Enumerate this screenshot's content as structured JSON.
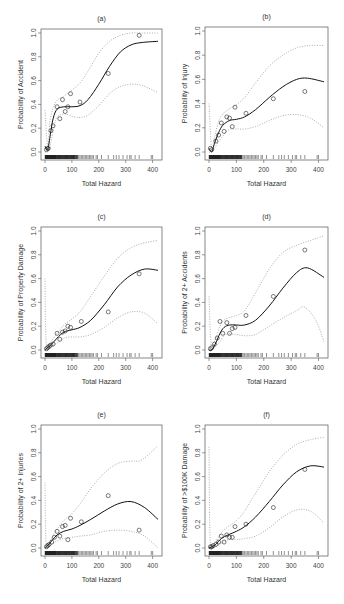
{
  "figure": {
    "xlabel": "Total Hazard",
    "x_ticks": [
      0,
      100,
      200,
      300,
      400
    ],
    "y_ticks": [
      "0.0",
      "0.2",
      "0.4",
      "0.6",
      "0.8",
      "1.0"
    ]
  },
  "chart_data": [
    {
      "type": "line",
      "panel": "(a)",
      "title": "(a)",
      "xlabel": "Total Hazard",
      "ylabel": "Probability of Accident",
      "xlim": [
        0,
        420
      ],
      "ylim": [
        0,
        1
      ],
      "fit": [
        [
          0,
          0.05
        ],
        [
          10,
          0.02
        ],
        [
          20,
          0.15
        ],
        [
          30,
          0.28
        ],
        [
          45,
          0.36
        ],
        [
          70,
          0.38
        ],
        [
          100,
          0.38
        ],
        [
          130,
          0.39
        ],
        [
          160,
          0.44
        ],
        [
          200,
          0.57
        ],
        [
          240,
          0.72
        ],
        [
          280,
          0.84
        ],
        [
          320,
          0.9
        ],
        [
          360,
          0.92
        ],
        [
          420,
          0.93
        ]
      ],
      "upper": [
        [
          0,
          0.35
        ],
        [
          10,
          0.05
        ],
        [
          20,
          0.28
        ],
        [
          40,
          0.42
        ],
        [
          70,
          0.47
        ],
        [
          100,
          0.52
        ],
        [
          130,
          0.58
        ],
        [
          160,
          0.68
        ],
        [
          200,
          0.83
        ],
        [
          240,
          0.93
        ],
        [
          280,
          0.98
        ],
        [
          320,
          1.0
        ],
        [
          360,
          1.0
        ],
        [
          420,
          1.0
        ]
      ],
      "lower": [
        [
          0,
          0.0
        ],
        [
          10,
          0.0
        ],
        [
          20,
          0.06
        ],
        [
          40,
          0.27
        ],
        [
          70,
          0.32
        ],
        [
          100,
          0.3
        ],
        [
          130,
          0.29
        ],
        [
          160,
          0.31
        ],
        [
          200,
          0.39
        ],
        [
          240,
          0.49
        ],
        [
          280,
          0.55
        ],
        [
          320,
          0.57
        ],
        [
          360,
          0.56
        ],
        [
          420,
          0.5
        ]
      ],
      "points": [
        [
          5,
          0.02
        ],
        [
          10,
          0.03
        ],
        [
          12,
          0.03
        ],
        [
          22,
          0.18
        ],
        [
          30,
          0.22
        ],
        [
          45,
          0.38
        ],
        [
          55,
          0.28
        ],
        [
          65,
          0.44
        ],
        [
          75,
          0.34
        ],
        [
          85,
          0.38
        ],
        [
          95,
          0.49
        ],
        [
          130,
          0.42
        ],
        [
          235,
          0.66
        ],
        [
          350,
          0.98
        ]
      ]
    },
    {
      "type": "line",
      "panel": "(b)",
      "title": "(b)",
      "xlabel": "Total Hazard",
      "ylabel": "Probability of Injury",
      "xlim": [
        0,
        420
      ],
      "ylim": [
        0,
        1
      ],
      "fit": [
        [
          0,
          0.03
        ],
        [
          10,
          0.0
        ],
        [
          20,
          0.07
        ],
        [
          35,
          0.16
        ],
        [
          50,
          0.22
        ],
        [
          75,
          0.26
        ],
        [
          100,
          0.27
        ],
        [
          130,
          0.29
        ],
        [
          170,
          0.35
        ],
        [
          220,
          0.45
        ],
        [
          270,
          0.54
        ],
        [
          320,
          0.6
        ],
        [
          360,
          0.61
        ],
        [
          420,
          0.58
        ]
      ],
      "upper": [
        [
          0,
          0.4
        ],
        [
          10,
          0.02
        ],
        [
          20,
          0.12
        ],
        [
          40,
          0.28
        ],
        [
          70,
          0.35
        ],
        [
          100,
          0.39
        ],
        [
          130,
          0.45
        ],
        [
          170,
          0.57
        ],
        [
          220,
          0.71
        ],
        [
          270,
          0.8
        ],
        [
          320,
          0.86
        ],
        [
          370,
          0.88
        ],
        [
          420,
          0.88
        ]
      ],
      "lower": [
        [
          0,
          0.0
        ],
        [
          10,
          0.0
        ],
        [
          20,
          0.03
        ],
        [
          40,
          0.1
        ],
        [
          70,
          0.18
        ],
        [
          100,
          0.19
        ],
        [
          130,
          0.19
        ],
        [
          170,
          0.21
        ],
        [
          220,
          0.26
        ],
        [
          270,
          0.3
        ],
        [
          320,
          0.31
        ],
        [
          370,
          0.28
        ],
        [
          420,
          0.2
        ]
      ],
      "points": [
        [
          5,
          0.03
        ],
        [
          10,
          0.02
        ],
        [
          25,
          0.09
        ],
        [
          35,
          0.14
        ],
        [
          45,
          0.24
        ],
        [
          55,
          0.17
        ],
        [
          65,
          0.29
        ],
        [
          75,
          0.28
        ],
        [
          85,
          0.21
        ],
        [
          95,
          0.37
        ],
        [
          135,
          0.32
        ],
        [
          235,
          0.44
        ],
        [
          350,
          0.5
        ]
      ]
    },
    {
      "type": "line",
      "panel": "(c)",
      "title": "(c)",
      "xlabel": "Total Hazard",
      "ylabel": "Probability of Property Damage",
      "xlim": [
        0,
        420
      ],
      "ylim": [
        0,
        1
      ],
      "fit": [
        [
          0,
          0.0
        ],
        [
          10,
          0.02
        ],
        [
          25,
          0.05
        ],
        [
          45,
          0.1
        ],
        [
          70,
          0.15
        ],
        [
          100,
          0.17
        ],
        [
          130,
          0.19
        ],
        [
          170,
          0.25
        ],
        [
          220,
          0.38
        ],
        [
          270,
          0.53
        ],
        [
          320,
          0.63
        ],
        [
          370,
          0.68
        ],
        [
          420,
          0.67
        ]
      ],
      "upper": [
        [
          0,
          0.6
        ],
        [
          5,
          0.05
        ],
        [
          25,
          0.08
        ],
        [
          45,
          0.14
        ],
        [
          70,
          0.21
        ],
        [
          100,
          0.26
        ],
        [
          130,
          0.32
        ],
        [
          170,
          0.45
        ],
        [
          220,
          0.62
        ],
        [
          270,
          0.77
        ],
        [
          320,
          0.86
        ],
        [
          370,
          0.9
        ],
        [
          420,
          0.92
        ]
      ],
      "lower": [
        [
          0,
          0.0
        ],
        [
          10,
          0.0
        ],
        [
          25,
          0.03
        ],
        [
          45,
          0.06
        ],
        [
          70,
          0.1
        ],
        [
          100,
          0.11
        ],
        [
          130,
          0.11
        ],
        [
          170,
          0.13
        ],
        [
          220,
          0.19
        ],
        [
          270,
          0.27
        ],
        [
          320,
          0.32
        ],
        [
          370,
          0.31
        ],
        [
          420,
          0.22
        ]
      ],
      "points": [
        [
          5,
          0.01
        ],
        [
          10,
          0.02
        ],
        [
          15,
          0.03
        ],
        [
          20,
          0.04
        ],
        [
          30,
          0.05
        ],
        [
          45,
          0.14
        ],
        [
          55,
          0.09
        ],
        [
          65,
          0.15
        ],
        [
          75,
          0.16
        ],
        [
          85,
          0.2
        ],
        [
          95,
          0.19
        ],
        [
          135,
          0.24
        ],
        [
          235,
          0.32
        ],
        [
          350,
          0.64
        ]
      ]
    },
    {
      "type": "line",
      "panel": "(d)",
      "title": "(d)",
      "xlabel": "Total Hazard",
      "ylabel": "Probability of 2+ Accidents",
      "xlim": [
        0,
        420
      ],
      "ylim": [
        0,
        1
      ],
      "fit": [
        [
          0,
          0.0
        ],
        [
          10,
          0.0
        ],
        [
          25,
          0.06
        ],
        [
          40,
          0.14
        ],
        [
          55,
          0.19
        ],
        [
          75,
          0.21
        ],
        [
          100,
          0.21
        ],
        [
          130,
          0.21
        ],
        [
          170,
          0.25
        ],
        [
          220,
          0.37
        ],
        [
          270,
          0.52
        ],
        [
          320,
          0.65
        ],
        [
          360,
          0.69
        ],
        [
          420,
          0.61
        ]
      ],
      "upper": [
        [
          0,
          0.45
        ],
        [
          8,
          0.05
        ],
        [
          25,
          0.1
        ],
        [
          40,
          0.2
        ],
        [
          60,
          0.26
        ],
        [
          100,
          0.29
        ],
        [
          130,
          0.33
        ],
        [
          170,
          0.48
        ],
        [
          220,
          0.68
        ],
        [
          270,
          0.82
        ],
        [
          320,
          0.88
        ],
        [
          370,
          0.92
        ],
        [
          420,
          0.96
        ]
      ],
      "lower": [
        [
          0,
          0.0
        ],
        [
          10,
          0.0
        ],
        [
          25,
          0.03
        ],
        [
          40,
          0.07
        ],
        [
          60,
          0.13
        ],
        [
          100,
          0.13
        ],
        [
          130,
          0.12
        ],
        [
          170,
          0.13
        ],
        [
          220,
          0.2
        ],
        [
          270,
          0.27
        ],
        [
          320,
          0.33
        ],
        [
          350,
          0.36
        ],
        [
          390,
          0.25
        ],
        [
          420,
          0.07
        ]
      ],
      "points": [
        [
          5,
          0.01
        ],
        [
          10,
          0.02
        ],
        [
          20,
          0.05
        ],
        [
          30,
          0.1
        ],
        [
          40,
          0.24
        ],
        [
          50,
          0.14
        ],
        [
          65,
          0.23
        ],
        [
          75,
          0.14
        ],
        [
          85,
          0.18
        ],
        [
          95,
          0.19
        ],
        [
          135,
          0.29
        ],
        [
          235,
          0.45
        ],
        [
          350,
          0.84
        ]
      ]
    },
    {
      "type": "line",
      "panel": "(e)",
      "title": "(e)",
      "xlabel": "Total Hazard",
      "ylabel": "Probability of 2+ Injuries",
      "xlim": [
        0,
        420
      ],
      "ylim": [
        0,
        1
      ],
      "fit": [
        [
          0,
          0.0
        ],
        [
          10,
          0.02
        ],
        [
          25,
          0.06
        ],
        [
          45,
          0.11
        ],
        [
          70,
          0.14
        ],
        [
          100,
          0.16
        ],
        [
          130,
          0.19
        ],
        [
          170,
          0.24
        ],
        [
          220,
          0.31
        ],
        [
          270,
          0.37
        ],
        [
          320,
          0.39
        ],
        [
          370,
          0.34
        ],
        [
          420,
          0.24
        ]
      ],
      "upper": [
        [
          0,
          0.55
        ],
        [
          5,
          0.03
        ],
        [
          25,
          0.09
        ],
        [
          45,
          0.16
        ],
        [
          70,
          0.23
        ],
        [
          100,
          0.29
        ],
        [
          130,
          0.37
        ],
        [
          170,
          0.5
        ],
        [
          220,
          0.63
        ],
        [
          270,
          0.71
        ],
        [
          320,
          0.73
        ],
        [
          360,
          0.74
        ],
        [
          420,
          0.86
        ]
      ],
      "lower": [
        [
          0,
          0.0
        ],
        [
          10,
          0.0
        ],
        [
          25,
          0.03
        ],
        [
          45,
          0.06
        ],
        [
          70,
          0.08
        ],
        [
          100,
          0.09
        ],
        [
          130,
          0.1
        ],
        [
          170,
          0.11
        ],
        [
          220,
          0.14
        ],
        [
          270,
          0.15
        ],
        [
          320,
          0.14
        ],
        [
          370,
          0.1
        ],
        [
          420,
          0.0
        ]
      ],
      "points": [
        [
          5,
          0.01
        ],
        [
          10,
          0.02
        ],
        [
          15,
          0.03
        ],
        [
          25,
          0.05
        ],
        [
          35,
          0.09
        ],
        [
          45,
          0.14
        ],
        [
          55,
          0.1
        ],
        [
          65,
          0.18
        ],
        [
          75,
          0.19
        ],
        [
          85,
          0.07
        ],
        [
          95,
          0.25
        ],
        [
          135,
          0.22
        ],
        [
          235,
          0.44
        ],
        [
          350,
          0.15
        ]
      ]
    },
    {
      "type": "line",
      "panel": "(f)",
      "title": "(f)",
      "xlabel": "Total Hazard",
      "ylabel": "Probability of >$100K Damage",
      "xlim": [
        0,
        420
      ],
      "ylim": [
        0,
        1
      ],
      "fit": [
        [
          0,
          0.0
        ],
        [
          10,
          0.01
        ],
        [
          25,
          0.03
        ],
        [
          45,
          0.08
        ],
        [
          70,
          0.11
        ],
        [
          100,
          0.14
        ],
        [
          130,
          0.18
        ],
        [
          170,
          0.26
        ],
        [
          220,
          0.39
        ],
        [
          270,
          0.53
        ],
        [
          320,
          0.64
        ],
        [
          370,
          0.69
        ],
        [
          420,
          0.68
        ]
      ],
      "upper": [
        [
          0,
          0.85
        ],
        [
          5,
          0.04
        ],
        [
          25,
          0.06
        ],
        [
          45,
          0.13
        ],
        [
          70,
          0.18
        ],
        [
          100,
          0.23
        ],
        [
          130,
          0.31
        ],
        [
          170,
          0.46
        ],
        [
          220,
          0.64
        ],
        [
          270,
          0.78
        ],
        [
          320,
          0.87
        ],
        [
          370,
          0.91
        ],
        [
          420,
          0.93
        ]
      ],
      "lower": [
        [
          0,
          0.0
        ],
        [
          10,
          0.0
        ],
        [
          25,
          0.01
        ],
        [
          45,
          0.04
        ],
        [
          70,
          0.07
        ],
        [
          100,
          0.07
        ],
        [
          130,
          0.08
        ],
        [
          170,
          0.1
        ],
        [
          220,
          0.17
        ],
        [
          270,
          0.26
        ],
        [
          320,
          0.32
        ],
        [
          370,
          0.31
        ],
        [
          420,
          0.21
        ]
      ],
      "points": [
        [
          5,
          0.01
        ],
        [
          10,
          0.01
        ],
        [
          15,
          0.02
        ],
        [
          25,
          0.03
        ],
        [
          35,
          0.05
        ],
        [
          45,
          0.1
        ],
        [
          55,
          0.05
        ],
        [
          65,
          0.11
        ],
        [
          75,
          0.09
        ],
        [
          85,
          0.09
        ],
        [
          95,
          0.18
        ],
        [
          135,
          0.2
        ],
        [
          235,
          0.34
        ],
        [
          350,
          0.66
        ]
      ]
    }
  ],
  "rug_x": [
    1,
    2,
    3,
    4,
    5,
    6,
    7,
    8,
    9,
    10,
    11,
    12,
    13,
    14,
    15,
    16,
    17,
    18,
    19,
    20,
    21,
    22,
    23,
    24,
    25,
    26,
    27,
    28,
    29,
    30,
    31,
    32,
    33,
    34,
    35,
    36,
    37,
    38,
    39,
    40,
    42,
    44,
    46,
    48,
    50,
    52,
    54,
    56,
    58,
    60,
    62,
    64,
    66,
    68,
    70,
    72,
    74,
    76,
    78,
    80,
    82,
    84,
    86,
    88,
    90,
    92,
    94,
    96,
    98,
    100,
    102,
    104,
    106,
    108,
    110,
    112,
    115,
    118,
    120,
    125,
    130,
    135,
    140,
    145,
    150,
    155,
    160,
    165,
    170,
    175,
    180,
    190,
    195,
    210,
    235,
    255,
    265,
    275,
    290,
    305,
    315,
    320,
    335,
    350,
    395,
    400
  ]
}
